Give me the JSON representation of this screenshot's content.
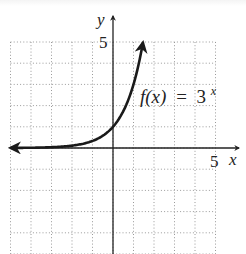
{
  "chart_data": {
    "type": "line",
    "title": "",
    "function_label": "f(x) = 3^x",
    "label_parts": {
      "fx": "f(x)",
      "eq": "=",
      "base": "3",
      "exp": "x"
    },
    "xlabel": "x",
    "ylabel": "y",
    "x_tick_label": "5",
    "y_tick_label": "5",
    "xlim": [
      -5,
      6
    ],
    "ylim": [
      -5,
      6
    ],
    "grid": true,
    "grid_style": "dotted",
    "grid_step": 1,
    "legend": null,
    "series": [
      {
        "name": "f(x) = 3^x",
        "x": [
          -5,
          -4,
          -3,
          -2,
          -1,
          0,
          0.5,
          1,
          1.25,
          1.46
        ],
        "y": [
          0.004,
          0.012,
          0.037,
          0.111,
          0.333,
          1,
          1.732,
          3,
          3.948,
          4.98
        ],
        "arrow_left": true,
        "arrow_right": true
      }
    ],
    "annotations": [
      {
        "text": "f(x) = 3^x",
        "x": 1.5,
        "y": 2.2
      }
    ]
  },
  "colors": {
    "curve": "#1a1a1a",
    "axes": "#222222",
    "grid": "#9a9a9a",
    "background": "#ffffff"
  }
}
